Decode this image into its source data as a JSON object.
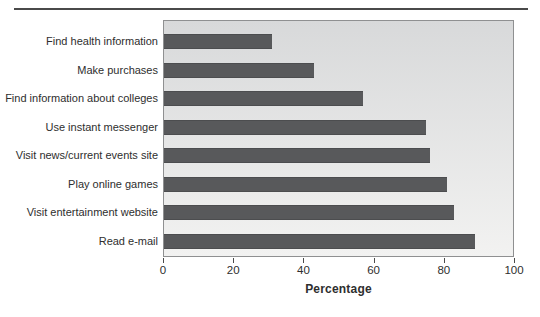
{
  "chart_data": {
    "type": "bar",
    "orientation": "horizontal",
    "title": "",
    "categories": [
      "Find health information",
      "Make purchases",
      "Find information about colleges",
      "Use instant messenger",
      "Visit news/current events site",
      "Play online games",
      "Visit entertainment website",
      "Read e-mail"
    ],
    "values": [
      31,
      43,
      57,
      75,
      76,
      81,
      83,
      89
    ],
    "xlabel": "Percentage",
    "xlim": [
      0,
      100
    ],
    "xticks": [
      0,
      20,
      40,
      60,
      80,
      100
    ],
    "grid": false,
    "legend": false,
    "colors": {
      "bar": "#58595b",
      "bar_border": "#4c4d4f",
      "plot_bg_top": "#d8d9da",
      "plot_bg_bottom": "#f2f2f1",
      "plot_border": "#8f9091",
      "top_rule": "#4a4a4a",
      "tick": "#4a4a4a",
      "text": "#2e2e2e"
    }
  }
}
